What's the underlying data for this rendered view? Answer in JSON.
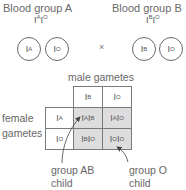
{
  "parents": [
    {
      "title": "Blood group A",
      "genotype": {
        "a": "A",
        "b": "O"
      },
      "gametes": [
        "A",
        "O"
      ]
    },
    {
      "title": "Blood group B",
      "genotype": {
        "a": "B",
        "b": "O"
      },
      "gametes": [
        "B",
        "O"
      ]
    }
  ],
  "cross_symbol": "×",
  "punnett": {
    "column_header_label": "male gametes",
    "row_header_label_line1": "female",
    "row_header_label_line2": "gametes",
    "allele_letter": "I",
    "male_gametes": [
      "B",
      "O"
    ],
    "female_gametes": [
      "A",
      "O"
    ],
    "offspring": [
      [
        {
          "a": "A",
          "b": "B"
        },
        {
          "a": "A",
          "b": "O"
        }
      ],
      [
        {
          "a": "B",
          "b": "O"
        },
        {
          "a": "O",
          "b": "O"
        }
      ]
    ],
    "shade_color": "#dddddd"
  },
  "annotations": [
    {
      "line1": "group AB",
      "line2": "child",
      "points_to": "I^A I^B"
    },
    {
      "line1": "group O",
      "line2": "child",
      "points_to": "I^O I^O"
    }
  ]
}
